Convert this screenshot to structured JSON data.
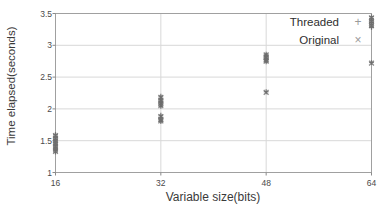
{
  "chart_data": {
    "type": "scatter",
    "title": "",
    "xlabel": "Variable size(bits)",
    "ylabel": "Time elapsed(seconds)",
    "xlim": [
      16,
      64
    ],
    "ylim": [
      1,
      3.5
    ],
    "xticks": [
      16,
      32,
      48,
      64
    ],
    "xtick_labels": [
      "16",
      "32",
      "48",
      "64"
    ],
    "yticks": [
      1,
      1.5,
      2,
      2.5,
      3,
      3.5
    ],
    "ytick_labels": [
      "1",
      "1.5",
      "2",
      "2.5",
      "3",
      "3.5"
    ],
    "grid": true,
    "grid_axis": "y",
    "legend_position": "upper right",
    "legend_frame": false,
    "marker_color": "#6e6e6e",
    "grid_color": "#d8d8d8",
    "frame_color": "#a0a0a0",
    "series": [
      {
        "name": "Threaded",
        "marker": "+",
        "marker_symbol": "+",
        "points": [
          {
            "x": 16,
            "y": 1.6
          },
          {
            "x": 16,
            "y": 1.57
          },
          {
            "x": 16,
            "y": 1.55
          },
          {
            "x": 16,
            "y": 1.52
          },
          {
            "x": 16,
            "y": 1.5
          },
          {
            "x": 16,
            "y": 1.48
          },
          {
            "x": 16,
            "y": 1.46
          },
          {
            "x": 16,
            "y": 1.44
          },
          {
            "x": 16,
            "y": 1.42
          },
          {
            "x": 16,
            "y": 1.4
          },
          {
            "x": 16,
            "y": 1.38
          },
          {
            "x": 16,
            "y": 1.36
          },
          {
            "x": 16,
            "y": 1.34
          },
          {
            "x": 16,
            "y": 1.32
          },
          {
            "x": 32,
            "y": 2.2
          },
          {
            "x": 32,
            "y": 2.17
          },
          {
            "x": 32,
            "y": 2.14
          },
          {
            "x": 32,
            "y": 2.12
          },
          {
            "x": 32,
            "y": 2.1
          },
          {
            "x": 32,
            "y": 2.08
          },
          {
            "x": 32,
            "y": 2.06
          },
          {
            "x": 32,
            "y": 2.04
          },
          {
            "x": 32,
            "y": 1.9
          },
          {
            "x": 32,
            "y": 1.87
          },
          {
            "x": 32,
            "y": 1.84
          },
          {
            "x": 32,
            "y": 1.82
          },
          {
            "x": 32,
            "y": 1.8
          },
          {
            "x": 48,
            "y": 2.86
          },
          {
            "x": 48,
            "y": 2.84
          },
          {
            "x": 48,
            "y": 2.82
          },
          {
            "x": 48,
            "y": 2.8
          },
          {
            "x": 48,
            "y": 2.78
          },
          {
            "x": 48,
            "y": 2.76
          },
          {
            "x": 48,
            "y": 2.74
          },
          {
            "x": 48,
            "y": 2.27
          },
          {
            "x": 64,
            "y": 3.45
          },
          {
            "x": 64,
            "y": 3.42
          },
          {
            "x": 64,
            "y": 3.39
          },
          {
            "x": 64,
            "y": 3.36
          },
          {
            "x": 64,
            "y": 3.33
          },
          {
            "x": 64,
            "y": 3.3
          },
          {
            "x": 64,
            "y": 3.28
          },
          {
            "x": 64,
            "y": 2.73
          }
        ]
      },
      {
        "name": "Original",
        "marker": "x",
        "marker_symbol": "×",
        "points": [
          {
            "x": 16,
            "y": 1.58
          },
          {
            "x": 16,
            "y": 1.54
          },
          {
            "x": 16,
            "y": 1.5
          },
          {
            "x": 16,
            "y": 1.45
          },
          {
            "x": 16,
            "y": 1.41
          },
          {
            "x": 16,
            "y": 1.37
          },
          {
            "x": 16,
            "y": 1.33
          },
          {
            "x": 32,
            "y": 2.18
          },
          {
            "x": 32,
            "y": 2.13
          },
          {
            "x": 32,
            "y": 2.09
          },
          {
            "x": 32,
            "y": 2.05
          },
          {
            "x": 32,
            "y": 1.88
          },
          {
            "x": 32,
            "y": 1.83
          },
          {
            "x": 32,
            "y": 1.81
          },
          {
            "x": 48,
            "y": 2.85
          },
          {
            "x": 48,
            "y": 2.81
          },
          {
            "x": 48,
            "y": 2.77
          },
          {
            "x": 48,
            "y": 2.75
          },
          {
            "x": 48,
            "y": 2.26
          },
          {
            "x": 64,
            "y": 3.43
          },
          {
            "x": 64,
            "y": 3.38
          },
          {
            "x": 64,
            "y": 3.34
          },
          {
            "x": 64,
            "y": 3.31
          },
          {
            "x": 64,
            "y": 2.72
          }
        ]
      }
    ]
  },
  "legend": {
    "entries": [
      {
        "label": "Threaded",
        "marker": "+"
      },
      {
        "label": "Original",
        "marker": "×"
      }
    ]
  }
}
